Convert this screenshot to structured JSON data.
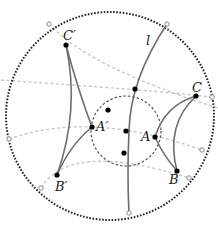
{
  "diagram": {
    "type": "hyperbolic-disk-reflection",
    "colors": {
      "boundary": "#222222",
      "geodesic": "#777777",
      "dashed_guides": "#bbbbbb",
      "inner_circle": "#555555",
      "points": "#000000",
      "ideal_points": "#888888"
    },
    "labels": {
      "line": "l",
      "A": "A",
      "B": "B",
      "C": "C",
      "A_prime": "A′",
      "B_prime": "B′",
      "C_prime": "C′"
    }
  }
}
